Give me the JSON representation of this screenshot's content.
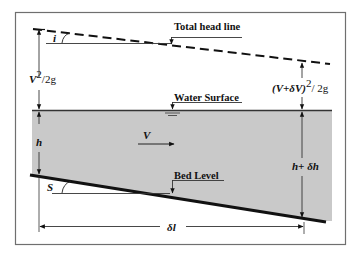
{
  "diagram": {
    "type": "open-channel-flow-element",
    "labels": {
      "total_head_line": "Total head line",
      "water_surface": "Water Surface",
      "bed_level": "Bed Level"
    },
    "symbols": {
      "head_slope_angle": "i",
      "bed_slope_angle": "S",
      "velocity": "V",
      "depth_upstream": "h",
      "depth_downstream": "h+ δh",
      "velocity_head_upstream_base": "V",
      "velocity_head_upstream_exp": "2",
      "velocity_head_upstream_tail": "/2g",
      "velocity_head_downstream_base": "(V+δV)",
      "velocity_head_downstream_exp": "2",
      "velocity_head_downstream_tail": "/ 2g",
      "length": "δl"
    },
    "colors": {
      "water_fill": "#c9c9c9",
      "line": "#111111",
      "frame": "#6f6f6f",
      "background": "#ffffff"
    }
  }
}
